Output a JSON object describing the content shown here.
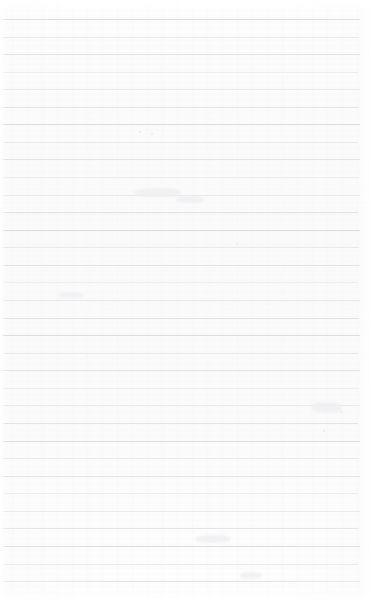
{
  "page": {
    "kind": "lined-paper-scan",
    "width": 372,
    "height": 602,
    "content_text": "",
    "is_blank": true
  },
  "paper": {
    "background_color": "#fdfdfd",
    "base_top_color": "#ffffff",
    "base_mid_color": "#fafafa",
    "base_bottom_color": "#ffffff",
    "vignette_color": "#f0f0f3",
    "grain_color": "#f4f4f7"
  },
  "ruling": {
    "style": "horizontal-ruled",
    "line_color": "#e3e3e7",
    "line_color_light": "#eeeef1",
    "line_color_dark": "#dcdce1",
    "line_thickness": 1,
    "spacing": 17.6,
    "first_line_y": 19,
    "line_count": 33,
    "left_inset": 2,
    "right_inset": 12,
    "has_vertical_margin_rule": false,
    "lines": [
      {
        "y": 19,
        "weight": "strong",
        "left": 2,
        "right": 360
      },
      {
        "y": 37,
        "weight": "alt",
        "left": 2,
        "right": 359
      },
      {
        "y": 54,
        "weight": "base",
        "left": 2,
        "right": 360
      },
      {
        "y": 72,
        "weight": "faint",
        "left": 3,
        "right": 358
      },
      {
        "y": 89,
        "weight": "alt",
        "left": 2,
        "right": 360
      },
      {
        "y": 107,
        "weight": "base",
        "left": 2,
        "right": 359
      },
      {
        "y": 124,
        "weight": "strong",
        "left": 2,
        "right": 360
      },
      {
        "y": 142,
        "weight": "alt",
        "left": 3,
        "right": 358
      },
      {
        "y": 159,
        "weight": "base",
        "left": 2,
        "right": 360
      },
      {
        "y": 177,
        "weight": "faint",
        "left": 2,
        "right": 359
      },
      {
        "y": 195,
        "weight": "alt",
        "left": 2,
        "right": 360
      },
      {
        "y": 212,
        "weight": "base",
        "left": 3,
        "right": 358
      },
      {
        "y": 230,
        "weight": "strong",
        "left": 2,
        "right": 360
      },
      {
        "y": 247,
        "weight": "alt",
        "left": 2,
        "right": 359
      },
      {
        "y": 265,
        "weight": "base",
        "left": 2,
        "right": 360
      },
      {
        "y": 282,
        "weight": "faint",
        "left": 3,
        "right": 358
      },
      {
        "y": 300,
        "weight": "alt",
        "left": 2,
        "right": 360
      },
      {
        "y": 318,
        "weight": "base",
        "left": 2,
        "right": 359
      },
      {
        "y": 335,
        "weight": "strong",
        "left": 2,
        "right": 360
      },
      {
        "y": 353,
        "weight": "alt",
        "left": 3,
        "right": 358
      },
      {
        "y": 370,
        "weight": "base",
        "left": 2,
        "right": 360
      },
      {
        "y": 388,
        "weight": "faint",
        "left": 2,
        "right": 359
      },
      {
        "y": 405,
        "weight": "alt",
        "left": 2,
        "right": 360
      },
      {
        "y": 423,
        "weight": "base",
        "left": 3,
        "right": 358
      },
      {
        "y": 441,
        "weight": "strong",
        "left": 2,
        "right": 360
      },
      {
        "y": 458,
        "weight": "alt",
        "left": 2,
        "right": 359
      },
      {
        "y": 476,
        "weight": "base",
        "left": 2,
        "right": 360
      },
      {
        "y": 493,
        "weight": "faint",
        "left": 3,
        "right": 358
      },
      {
        "y": 511,
        "weight": "alt",
        "left": 2,
        "right": 360
      },
      {
        "y": 528,
        "weight": "base",
        "left": 2,
        "right": 359
      },
      {
        "y": 546,
        "weight": "strong",
        "left": 2,
        "right": 360
      },
      {
        "y": 564,
        "weight": "alt",
        "left": 3,
        "right": 358
      },
      {
        "y": 581,
        "weight": "base",
        "left": 2,
        "right": 360
      }
    ]
  },
  "artifacts": {
    "specks": [
      {
        "x": 139,
        "y": 131,
        "size": 2
      },
      {
        "x": 151,
        "y": 133,
        "size": 2
      },
      {
        "x": 162,
        "y": 129,
        "size": 1
      },
      {
        "x": 236,
        "y": 243,
        "size": 2
      },
      {
        "x": 245,
        "y": 247,
        "size": 1
      },
      {
        "x": 340,
        "y": 411,
        "size": 2
      },
      {
        "x": 331,
        "y": 418,
        "size": 1
      },
      {
        "x": 323,
        "y": 430,
        "size": 2
      },
      {
        "x": 197,
        "y": 520,
        "size": 1
      },
      {
        "x": 86,
        "y": 356,
        "size": 1
      },
      {
        "x": 268,
        "y": 310,
        "size": 1
      },
      {
        "x": 110,
        "y": 465,
        "size": 1
      }
    ],
    "smudges": [
      {
        "x": 135,
        "y": 188,
        "w": 46,
        "h": 9
      },
      {
        "x": 176,
        "y": 196,
        "w": 28,
        "h": 7
      },
      {
        "x": 312,
        "y": 402,
        "w": 30,
        "h": 11
      },
      {
        "x": 196,
        "y": 535,
        "w": 34,
        "h": 8
      },
      {
        "x": 58,
        "y": 292,
        "w": 26,
        "h": 6
      },
      {
        "x": 240,
        "y": 572,
        "w": 22,
        "h": 7
      }
    ]
  }
}
